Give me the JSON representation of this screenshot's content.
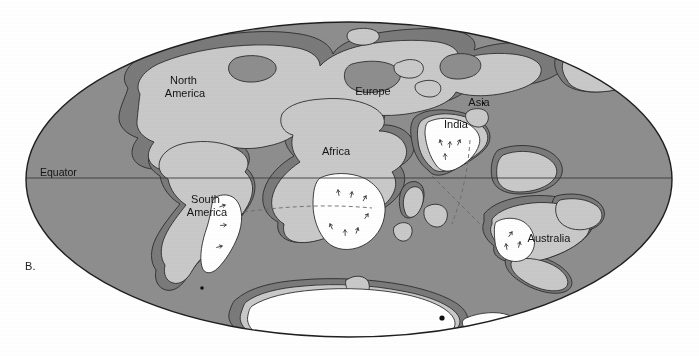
{
  "figure": {
    "panel_letter": "B.",
    "kind": "paleogeographic world map",
    "projection": "Mollweide (elliptical) world projection"
  },
  "map": {
    "equator_label": "Equator",
    "colors": {
      "ocean": "#8e8e8e",
      "shelf": "#7b7b7b",
      "land": "#c9c9c9",
      "ice": "#ffffff",
      "outline": "#2e2e2e",
      "background": "#ffffff",
      "label_text": "#141414"
    },
    "ellipse": {
      "cx": 349,
      "cy": 179.5,
      "rx": 323,
      "ry": 157.5
    },
    "equator_line": {
      "y": 178,
      "x_start": 26,
      "x_end": 672
    },
    "labels": [
      {
        "name": "north-america",
        "text": "North\nAmerica",
        "lines": [
          "North",
          "America"
        ],
        "x": 185,
        "y": 87
      },
      {
        "name": "europe",
        "text": "Europe",
        "lines": [
          "Europe"
        ],
        "x": 373,
        "y": 92
      },
      {
        "name": "asia",
        "text": "Asia",
        "lines": [
          "Asia"
        ],
        "x": 479,
        "y": 103
      },
      {
        "name": "india",
        "text": "India",
        "lines": [
          "India"
        ],
        "x": 456,
        "y": 125
      },
      {
        "name": "africa",
        "text": "Africa",
        "lines": [
          "Africa"
        ],
        "x": 336,
        "y": 152
      },
      {
        "name": "south-america",
        "text": "South\nAmerica",
        "lines": [
          "South",
          "America"
        ],
        "x": 207,
        "y": 206
      },
      {
        "name": "australia",
        "text": "Australia",
        "lines": [
          "Australia"
        ],
        "x": 549,
        "y": 239
      }
    ],
    "equator_label_pos": {
      "x": 40,
      "y": 176
    }
  }
}
